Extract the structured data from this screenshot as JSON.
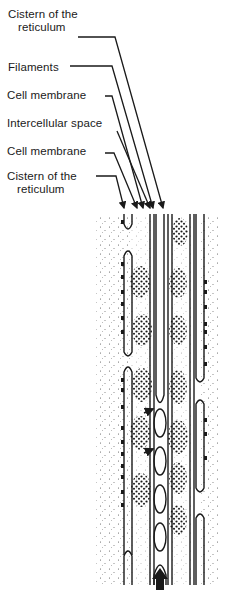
{
  "figure": {
    "type": "labeled anatomical diagram",
    "labels": [
      {
        "id": "cistern-top",
        "line1": "Cistern of the",
        "line2": "reticulum"
      },
      {
        "id": "filaments",
        "line1": "Filaments"
      },
      {
        "id": "cell-membrane-1",
        "line1": "Cell membrane"
      },
      {
        "id": "intercellular-space",
        "line1": "Intercellular space"
      },
      {
        "id": "cell-membrane-2",
        "line1": "Cell  membrane"
      },
      {
        "id": "cistern-bottom",
        "line1": "Cistern of the",
        "line2": "reticulum"
      }
    ],
    "indicator": "upward-arrow-icon",
    "colors": {
      "ink": "#1a1a1a",
      "background": "#ffffff",
      "stipple": "#555555"
    }
  }
}
